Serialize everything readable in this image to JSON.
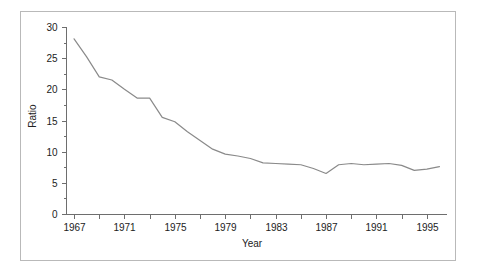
{
  "chart_data": {
    "type": "line",
    "title": "",
    "xlabel": "Year",
    "ylabel": "Ratio",
    "xlim": [
      1966.4,
      1996.6
    ],
    "ylim": [
      0,
      30
    ],
    "grid": false,
    "legend": "none",
    "line_color": "#8a8a8a",
    "axis_color": "#6e6e6e",
    "frame_color": "#b9b9b9",
    "background": "#ffffff",
    "y_ticks": [
      0,
      5,
      10,
      15,
      20,
      25,
      30
    ],
    "y_tick_labels": [
      "0",
      "5",
      "10",
      "15",
      "20",
      "25",
      "30"
    ],
    "y_minor_ticks": [
      2.5,
      7.5,
      12.5,
      17.5,
      22.5,
      27.5
    ],
    "x_ticks": [
      1967,
      1969,
      1971,
      1973,
      1975,
      1977,
      1979,
      1981,
      1983,
      1985,
      1987,
      1989,
      1991,
      1993,
      1995
    ],
    "x_tick_labels": [
      "1967",
      "",
      "1971",
      "",
      "1975",
      "",
      "1979",
      "",
      "1983",
      "",
      "1987",
      "",
      "1991",
      "",
      "1995"
    ],
    "x_labeled_ticks": [
      1967,
      1971,
      1975,
      1979,
      1983,
      1987,
      1991,
      1995
    ],
    "x": [
      1967,
      1968,
      1969,
      1970,
      1971,
      1972,
      1973,
      1974,
      1975,
      1976,
      1977,
      1978,
      1979,
      1980,
      1981,
      1982,
      1983,
      1984,
      1985,
      1986,
      1987,
      1988,
      1989,
      1990,
      1991,
      1992,
      1993,
      1994,
      1995,
      1996
    ],
    "values": [
      28.1,
      25.2,
      22.0,
      21.5,
      20.0,
      18.6,
      18.6,
      15.5,
      14.8,
      13.2,
      11.8,
      10.4,
      9.6,
      9.3,
      8.9,
      8.2,
      8.1,
      8.0,
      7.9,
      7.3,
      6.5,
      7.9,
      8.1,
      7.9,
      8.0,
      8.1,
      7.8,
      7.0,
      7.2,
      7.6
    ],
    "series_name": "Ratio"
  }
}
